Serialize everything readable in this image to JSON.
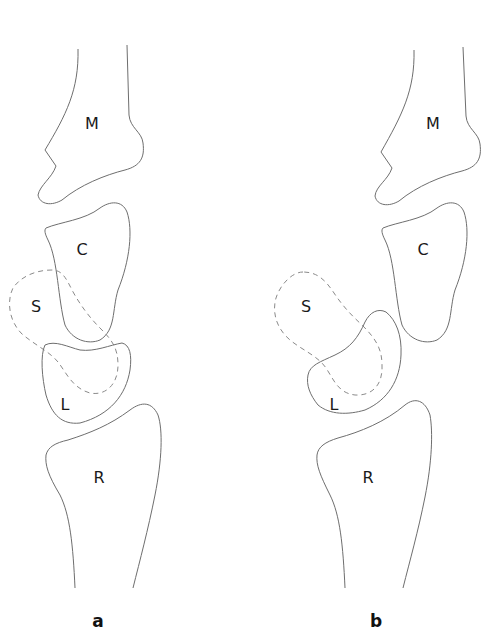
{
  "figure": {
    "panels": [
      {
        "label": "a",
        "bones": {
          "metacarpal": "M",
          "capitate": "C",
          "scaphoid": "S",
          "lunate": "L",
          "radius": "R"
        }
      },
      {
        "label": "b",
        "bones": {
          "metacarpal": "M",
          "capitate": "C",
          "scaphoid": "S",
          "lunate": "L",
          "radius": "R"
        }
      }
    ],
    "legend_notes": {
      "dashed_outline": "scaphoid (S)",
      "solid_outline": "other bones"
    },
    "colors": {
      "outline": "#6e6e6e",
      "dashed": "#8a8a8a",
      "text": "#1a1a1a",
      "background": "#ffffff"
    }
  }
}
